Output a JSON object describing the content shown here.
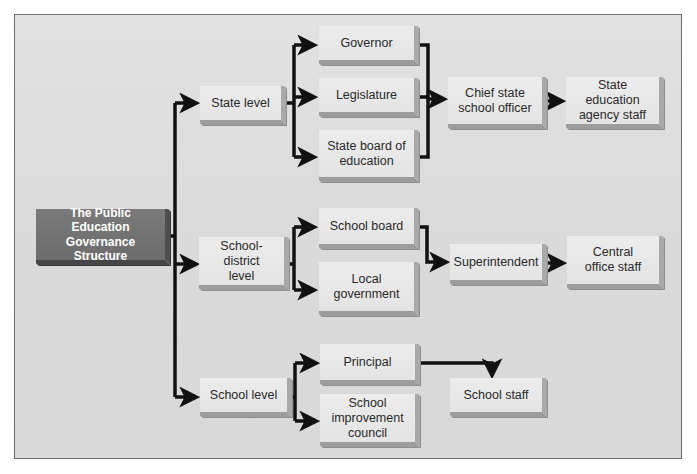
{
  "diagram": {
    "title": "The Public Education Governance Structure",
    "root": {
      "label": "The Public Education\nGovernance\nStructure"
    },
    "levels": [
      {
        "label": "State level",
        "authorities": [
          {
            "label": "Governor"
          },
          {
            "label": "Legislature"
          },
          {
            "label": "State board of\neducation"
          }
        ],
        "officer": {
          "label": "Chief state\nschool officer"
        },
        "staff": {
          "label": "State education\nagency staff"
        }
      },
      {
        "label": "School-district\nlevel",
        "authorities": [
          {
            "label": "School board"
          },
          {
            "label": "Local\ngovernment"
          }
        ],
        "officer": {
          "label": "Superintendent"
        },
        "staff": {
          "label": "Central\noffice staff"
        }
      },
      {
        "label": "School level",
        "authorities": [
          {
            "label": "Principal"
          },
          {
            "label": "School\nimprovement\ncouncil"
          }
        ],
        "staff": {
          "label": "School staff"
        }
      }
    ],
    "colors": {
      "frame_bg": "#dcdcdc",
      "box_face": "#e8e8e8",
      "box_bevel": "#a0a0a0",
      "root_face": "#737373",
      "connector": "#111111"
    }
  }
}
